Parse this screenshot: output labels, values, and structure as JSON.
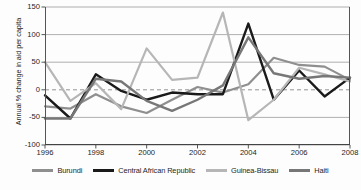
{
  "chart_data": {
    "type": "line",
    "title": "",
    "xlabel": "",
    "ylabel": "Annual % change in aid per capita",
    "x": [
      1996,
      1997,
      1998,
      1999,
      2000,
      2001,
      2002,
      2003,
      2004,
      2005,
      2006,
      2007,
      2008
    ],
    "xlim": [
      1996,
      2008
    ],
    "ylim": [
      -100,
      150
    ],
    "yticks": [
      150,
      100,
      50,
      0,
      -50,
      -100
    ],
    "xticks": [
      1996,
      1998,
      2000,
      2002,
      2004,
      2006,
      2008
    ],
    "xtick_labels": [
      "1996",
      "1998",
      "2000",
      "2002",
      "2004",
      "2006",
      "2008"
    ],
    "ytick_labels": [
      "150",
      "100",
      "50",
      "0",
      "-50",
      "-100"
    ],
    "grid": "horizontal",
    "zero_line": "dashed",
    "legend_position": "bottom",
    "series": [
      {
        "name": "Burundi",
        "color": "#8f8f8f",
        "width": 2.2,
        "values": [
          -30,
          -34,
          -8,
          -30,
          -42,
          -18,
          5,
          -5,
          10,
          58,
          45,
          42,
          18
        ]
      },
      {
        "name": "Central African Republic",
        "color": "#1a1a1a",
        "width": 2.4,
        "values": [
          -10,
          -52,
          28,
          -2,
          -18,
          -5,
          -8,
          -8,
          120,
          -18,
          35,
          -12,
          22
        ]
      },
      {
        "name": "Guinea-Bissau",
        "color": "#b6b6b6",
        "width": 2.2,
        "values": [
          50,
          -20,
          12,
          -35,
          75,
          18,
          22,
          140,
          -55,
          -18,
          40,
          28,
          15
        ]
      },
      {
        "name": "Haiti",
        "color": "#777777",
        "width": 2.4,
        "values": [
          -52,
          -52,
          20,
          15,
          -20,
          -38,
          -18,
          8,
          95,
          30,
          20,
          25,
          22
        ]
      }
    ]
  }
}
